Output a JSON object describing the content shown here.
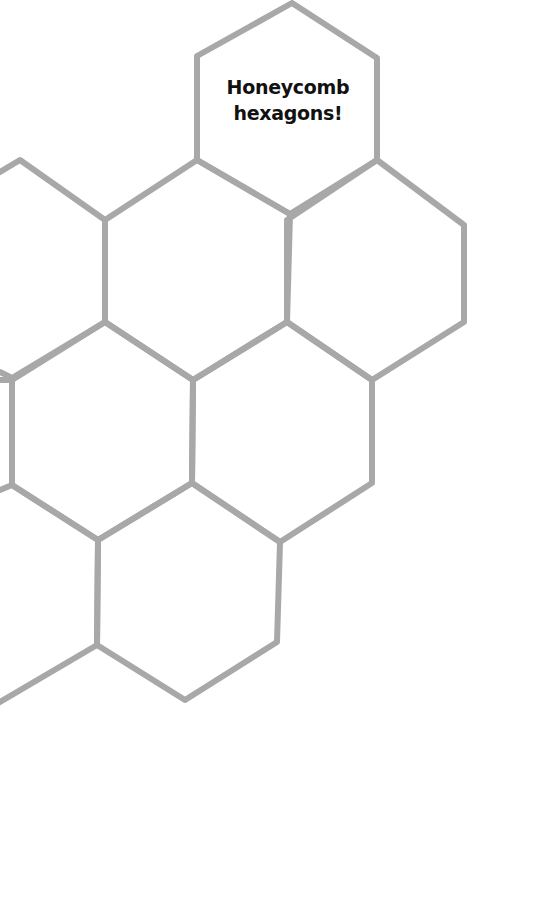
{
  "title": {
    "line1": "Honeycomb",
    "line2": "hexagons!"
  },
  "colors": {
    "background": "#ffffff",
    "hex_stroke": "#a8a8a8",
    "text": "#111111"
  }
}
